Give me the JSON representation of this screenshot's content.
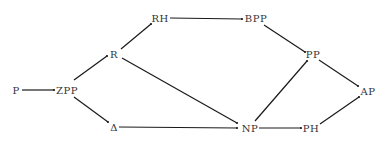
{
  "diagram": {
    "type": "directed-graph",
    "colors": {
      "ink": "#1a1a1a",
      "label": "#333333",
      "background": "#ffffff"
    },
    "nodes": [
      {
        "id": "P",
        "label": "P",
        "x": 16,
        "y": 90
      },
      {
        "id": "ZPP",
        "label": "ZPP",
        "x": 67,
        "y": 90
      },
      {
        "id": "R",
        "label": "R",
        "x": 114,
        "y": 54
      },
      {
        "id": "RH",
        "label": "RH",
        "x": 160,
        "y": 18
      },
      {
        "id": "BPP",
        "label": "BPP",
        "x": 256,
        "y": 18
      },
      {
        "id": "PP",
        "label": "PP",
        "x": 313,
        "y": 54
      },
      {
        "id": "AP",
        "label": "AP",
        "x": 368,
        "y": 91
      },
      {
        "id": "DELTA",
        "label": "Δ",
        "x": 114,
        "y": 127
      },
      {
        "id": "NP",
        "label": "NP",
        "x": 250,
        "y": 128
      },
      {
        "id": "PH",
        "label": "PH",
        "x": 311,
        "y": 128
      }
    ],
    "edges": [
      {
        "from": "P",
        "to": "ZPP",
        "x1": 22,
        "y1": 90,
        "x2": 54,
        "y2": 90
      },
      {
        "from": "ZPP",
        "to": "R",
        "x1": 74,
        "y1": 80,
        "x2": 107,
        "y2": 56
      },
      {
        "from": "ZPP",
        "to": "DELTA",
        "x1": 74,
        "y1": 97,
        "x2": 108,
        "y2": 122
      },
      {
        "from": "R",
        "to": "RH",
        "x1": 121,
        "y1": 49,
        "x2": 151,
        "y2": 24
      },
      {
        "from": "RH",
        "to": "BPP",
        "x1": 170,
        "y1": 18,
        "x2": 242,
        "y2": 19
      },
      {
        "from": "BPP",
        "to": "PP",
        "x1": 264,
        "y1": 25,
        "x2": 305,
        "y2": 52
      },
      {
        "from": "R",
        "to": "NP",
        "x1": 122,
        "y1": 58,
        "x2": 237,
        "y2": 123
      },
      {
        "from": "DELTA",
        "to": "NP",
        "x1": 119,
        "y1": 127,
        "x2": 237,
        "y2": 128
      },
      {
        "from": "NP",
        "to": "PP",
        "x1": 255,
        "y1": 121,
        "x2": 307,
        "y2": 61
      },
      {
        "from": "NP",
        "to": "PH",
        "x1": 259,
        "y1": 128,
        "x2": 301,
        "y2": 128
      },
      {
        "from": "PP",
        "to": "AP",
        "x1": 319,
        "y1": 60,
        "x2": 358,
        "y2": 86
      },
      {
        "from": "PH",
        "to": "AP",
        "x1": 320,
        "y1": 124,
        "x2": 359,
        "y2": 97
      }
    ]
  }
}
